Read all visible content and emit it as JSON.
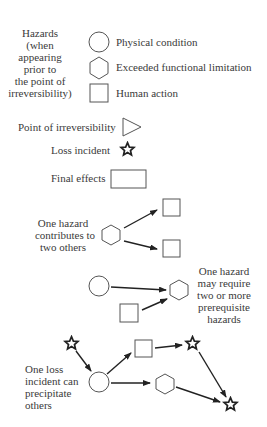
{
  "legend": {
    "hazards_label": [
      "Hazards",
      "(when",
      "appearing",
      "prior to",
      "the point of",
      "irreversibility)"
    ],
    "items": [
      {
        "icon": "circle-icon",
        "label": "Physical condition"
      },
      {
        "icon": "hexagon-icon",
        "label": "Exceeded functional limitation"
      },
      {
        "icon": "square-icon",
        "label": "Human action"
      }
    ],
    "point_of_irreversibility": {
      "icon": "triangle-icon",
      "label": "Point of irreversibility"
    },
    "loss_incident": {
      "icon": "star-icon",
      "label": "Loss incident"
    },
    "final_effects": {
      "icon": "rectangle-icon",
      "label": "Final effects"
    }
  },
  "examples": [
    {
      "caption": [
        "One hazard",
        "contributes to",
        "two others"
      ]
    },
    {
      "caption": [
        "One hazard",
        "may require",
        "two or more",
        "prerequisite",
        "hazards"
      ]
    },
    {
      "caption": [
        "One loss",
        "incident can",
        "precipitate",
        "others"
      ]
    }
  ],
  "colors": {
    "stroke": "#555555",
    "arrow": "#222222",
    "text": "#3a3a3a",
    "background": "#ffffff"
  }
}
